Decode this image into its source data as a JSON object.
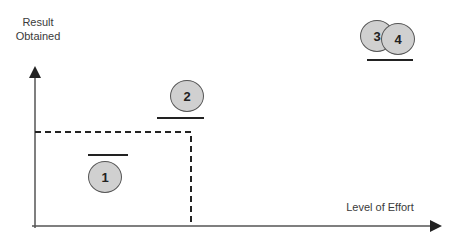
{
  "diagram": {
    "y_axis_label_line1": "Result",
    "y_axis_label_line2": "Obtained",
    "x_axis_label": "Level of Effort",
    "markers": [
      {
        "id": "1",
        "label": "1",
        "bar_position": "above"
      },
      {
        "id": "2",
        "label": "2",
        "bar_position": "below"
      },
      {
        "id": "3",
        "label": "3",
        "bar_position": "below"
      },
      {
        "id": "4",
        "label": "4",
        "bar_position": "below"
      }
    ],
    "threshold_box": "dashed",
    "colors": {
      "marker_fill": "#d0d0d0",
      "marker_stroke": "#555555",
      "line": "#222222"
    }
  }
}
